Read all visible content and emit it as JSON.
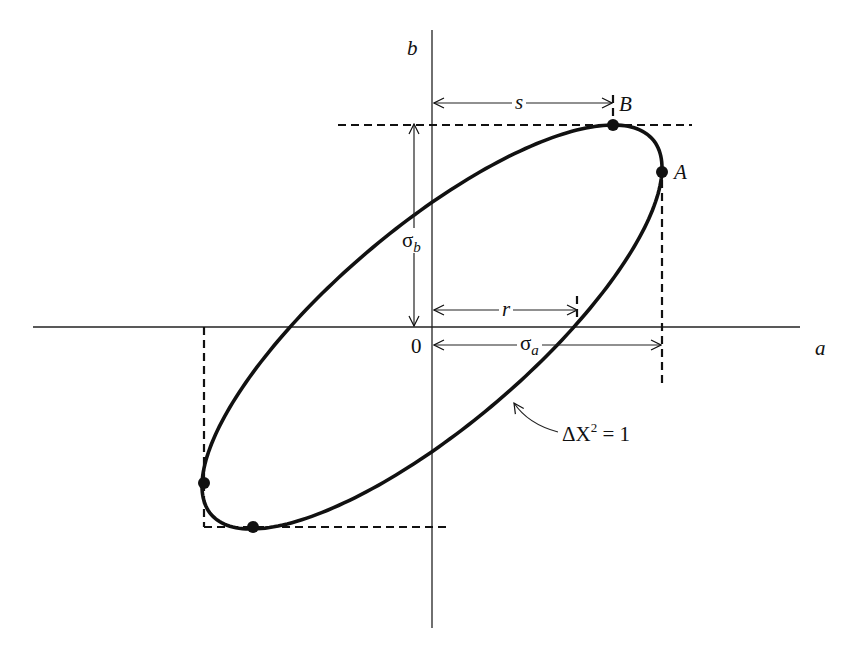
{
  "figure": {
    "colors": {
      "ink": "#111111",
      "background": "#ffffff"
    },
    "axes": {
      "x_label": "a",
      "y_label": "b",
      "origin_label": "0",
      "origin_px": [
        432,
        327
      ],
      "x_axis_px": [
        33,
        800
      ],
      "y_axis_px": [
        30,
        628
      ]
    },
    "ellipse": {
      "center_px": [
        432,
        327
      ],
      "top_point_B_px": [
        613,
        125
      ],
      "right_point_A_px": [
        662,
        172
      ],
      "bottom_point_px": [
        253,
        527
      ],
      "left_point_px": [
        204,
        483
      ],
      "stroke_width": 3.6,
      "curve_label": "ΔΧ² = 1",
      "curve_label_parts": {
        "prefix": "ΔΧ",
        "sup": "2",
        "suffix": " = 1"
      }
    },
    "points": [
      {
        "name": "B",
        "label": "B",
        "px": [
          613,
          125
        ]
      },
      {
        "name": "A",
        "label": "A",
        "px": [
          662,
          172
        ]
      },
      {
        "name": "bottom-left-tangent",
        "label": "",
        "px": [
          204,
          483
        ]
      },
      {
        "name": "bottom-tangent",
        "label": "",
        "px": [
          253,
          527
        ]
      }
    ],
    "dimension_labels": {
      "s": "s",
      "r": "r",
      "sigma_a": {
        "base": "σ",
        "sub": "a"
      },
      "sigma_b": {
        "base": "σ",
        "sub": "b"
      }
    },
    "dimensions": {
      "s_arrow_px": {
        "from": [
          434,
          103
        ],
        "to": [
          612,
          103
        ]
      },
      "r_arrow_px": {
        "from": [
          434,
          310
        ],
        "to": [
          577,
          310
        ]
      },
      "sigma_a_arrow_px": {
        "from": [
          434,
          345
        ],
        "to": [
          661,
          345
        ]
      },
      "sigma_b_arrow_px": {
        "from": [
          414,
          124
        ],
        "to": [
          414,
          326
        ]
      }
    },
    "dashed_lines_px": [
      {
        "name": "top-tangent",
        "from": [
          338,
          125
        ],
        "to": [
          692,
          125
        ]
      },
      {
        "name": "right-tangent",
        "from": [
          662,
          180
        ],
        "to": [
          662,
          388
        ]
      },
      {
        "name": "left-tangent",
        "from": [
          204,
          327
        ],
        "to": [
          204,
          527
        ]
      },
      {
        "name": "bottom-tangent",
        "from": [
          204,
          527
        ],
        "to": [
          450,
          527
        ]
      },
      {
        "name": "r-tick",
        "from": [
          577,
          296
        ],
        "to": [
          577,
          318
        ]
      },
      {
        "name": "s-tick",
        "from": [
          613,
          95
        ],
        "to": [
          613,
          118
        ]
      }
    ]
  }
}
